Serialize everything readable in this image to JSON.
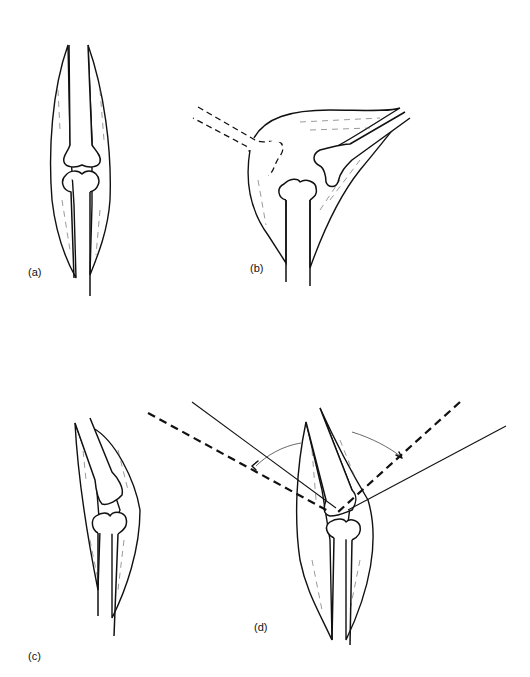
{
  "figure": {
    "panels": [
      {
        "id": "a",
        "label": "(a)"
      },
      {
        "id": "b",
        "label": "(b)"
      },
      {
        "id": "c",
        "label": "(c)"
      },
      {
        "id": "d",
        "label": "(d)"
      }
    ],
    "colors": {
      "ink": "#111111",
      "background": "#ffffff"
    }
  }
}
